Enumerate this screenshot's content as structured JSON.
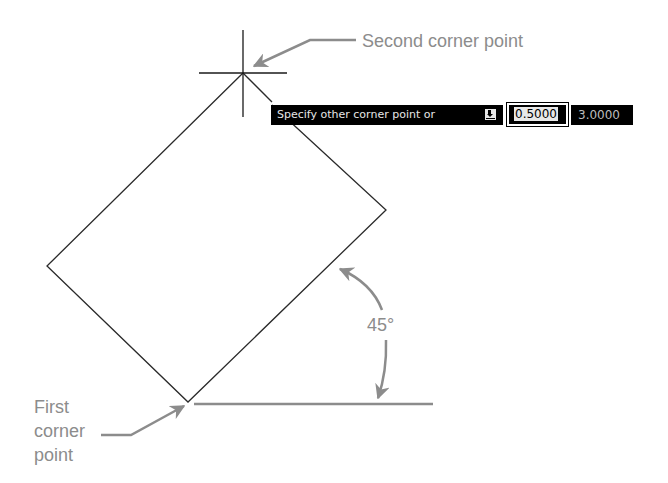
{
  "diagram": {
    "colors": {
      "geometry": "#2a2a2a",
      "annotation": "#8c8c8c",
      "tooltip_bg": "#000000",
      "tooltip_text": "#e6e6e6"
    },
    "rectangle": {
      "rotation_degrees": 45,
      "first_corner": [
        188,
        402
      ],
      "left_corner": [
        47,
        266
      ],
      "second_corner": [
        243,
        73
      ],
      "right_corner": [
        386,
        210
      ]
    },
    "crosshair": {
      "center": [
        243,
        73
      ]
    }
  },
  "labels": {
    "second_corner": "Second corner point",
    "first_corner_lines": [
      "First",
      "corner",
      "point"
    ],
    "angle": "45°"
  },
  "dynamic_input": {
    "prompt": "Specify other corner point or",
    "options_icon": "down-arrow-options-icon",
    "active_value": "0.5000",
    "second_value": "3.0000"
  }
}
